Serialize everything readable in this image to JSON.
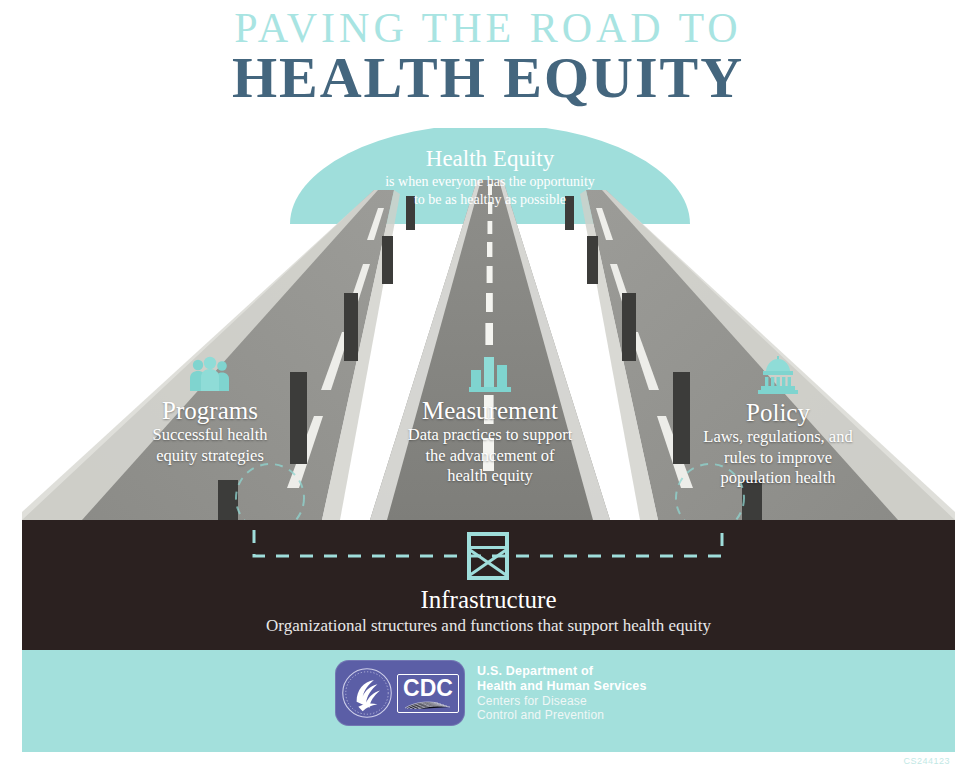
{
  "title": {
    "line1": "PAVING THE ROAD TO",
    "line2": "HEALTH EQUITY",
    "line1_color": "#a8e4e2",
    "line2_color": "#44667e"
  },
  "dome": {
    "heading": "Health Equity",
    "description_line1": "is when everyone has the opportunity",
    "description_line2": "to be as healthy as possible",
    "color": "#9fdedb"
  },
  "pillars": [
    {
      "id": "programs",
      "icon": "people-group-icon",
      "title": "Programs",
      "desc_line1": "Successful health",
      "desc_line2": "equity strategies"
    },
    {
      "id": "measurement",
      "icon": "bar-chart-icon",
      "title": "Measurement",
      "desc_line1": "Data practices to support",
      "desc_line2": "the advancement of",
      "desc_line3": "health equity"
    },
    {
      "id": "policy",
      "icon": "capitol-building-icon",
      "title": "Policy",
      "desc_line1": "Laws, regulations, and",
      "desc_line2": "rules to improve",
      "desc_line3": "population health"
    }
  ],
  "infrastructure": {
    "icon": "bridge-truss-icon",
    "title": "Infrastructure",
    "description": "Organizational structures and functions that support health equity",
    "band_color": "#2b2120"
  },
  "footer": {
    "band_color": "#a3e0dc",
    "logo": {
      "badge_color": "#5b5ea6",
      "seal": "hhs-seal-icon",
      "wordmark": "CDC",
      "agency_line1": "U.S. Department of",
      "agency_line2": "Health and Human Services",
      "agency_line3": "Centers for Disease",
      "agency_line4": "Control and Prevention"
    },
    "cs_mark": "CS244123"
  },
  "palette": {
    "accent_teal": "#7fd4cf",
    "road_gray": "#8c8c88",
    "road_gray_light": "#a6a6a1",
    "road_edge": "#e6e6e2",
    "pillar_dark": "#3a3a38",
    "dark_band": "#2b2120"
  }
}
